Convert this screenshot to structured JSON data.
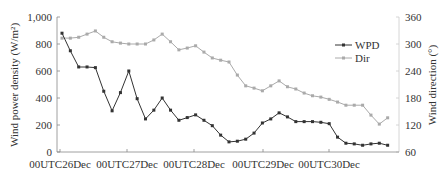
{
  "chart_data": {
    "type": "line",
    "title": "",
    "xlabel": "",
    "ylabel": "Wind power density (W/m²)",
    "y2label": "Wind direction (°)",
    "ylim": [
      0,
      1000
    ],
    "y2lim": [
      60,
      360
    ],
    "y_ticks": [
      "0",
      "200",
      "400",
      "600",
      "800",
      "1,000"
    ],
    "y2_ticks": [
      "60",
      "120",
      "180",
      "240",
      "300",
      "360"
    ],
    "x_tick_labels": [
      "00UTC26Dec",
      "00UTC27Dec",
      "00UTC28Dec",
      "00UTC29Dec",
      "00UTC30Dec"
    ],
    "x_interval_hours": 3,
    "grid": false,
    "legend_position": "upper right",
    "series": [
      {
        "name": "WPD",
        "axis": "left",
        "color": "#333333",
        "marker": "square",
        "values": [
          880,
          750,
          630,
          630,
          625,
          450,
          305,
          440,
          600,
          395,
          245,
          310,
          400,
          310,
          235,
          255,
          275,
          235,
          195,
          125,
          75,
          80,
          95,
          140,
          215,
          245,
          290,
          260,
          225,
          225,
          225,
          220,
          210,
          110,
          65,
          60,
          50,
          60,
          65,
          50
        ]
      },
      {
        "name": "Dir",
        "axis": "right",
        "color": "#aaaaaa",
        "marker": "square",
        "values": [
          313,
          313,
          315,
          322,
          329,
          315,
          305,
          302,
          300,
          300,
          300,
          309,
          322,
          305,
          287,
          291,
          296,
          282,
          269,
          264,
          260,
          231,
          207,
          202,
          196,
          207,
          218,
          205,
          200,
          191,
          185,
          182,
          177,
          171,
          164,
          164,
          164,
          142,
          122,
          136
        ]
      }
    ]
  }
}
